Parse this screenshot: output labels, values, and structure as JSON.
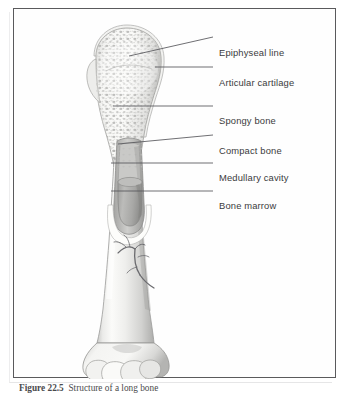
{
  "figure": {
    "title": "Structure of a long bone",
    "background_color": "#ffffff",
    "frame_color": "#5a5a5c",
    "leader_line_color": "#55555a"
  },
  "labels": [
    {
      "id": "epiphyseal-line",
      "text": "Epiphyseal line",
      "text_x": 218,
      "text_y": 44,
      "leader": {
        "x1": 128,
        "y1": 60,
        "x2": 212,
        "y2": 41
      }
    },
    {
      "id": "articular-cartilage",
      "text": "Articular cartilage",
      "text_x": 218,
      "text_y": 74,
      "leader": {
        "x1": 154,
        "y1": 71,
        "x2": 212,
        "y2": 71
      }
    },
    {
      "id": "spongy-bone",
      "text": "Spongy bone",
      "text_x": 218,
      "text_y": 112,
      "leader": {
        "x1": 112,
        "y1": 110,
        "x2": 212,
        "y2": 110
      }
    },
    {
      "id": "compact-bone",
      "text": "Compact bone",
      "text_x": 218,
      "text_y": 142,
      "leader": {
        "x1": 117,
        "y1": 148,
        "x2": 212,
        "y2": 139
      }
    },
    {
      "id": "medullary-cavity",
      "text": "Medullary cavity",
      "text_x": 218,
      "text_y": 169,
      "leader": {
        "x1": 110,
        "y1": 167,
        "x2": 212,
        "y2": 167
      }
    },
    {
      "id": "bone-marrow",
      "text": "Bone marrow",
      "text_x": 218,
      "text_y": 197,
      "leader": {
        "x1": 110,
        "y1": 195,
        "x2": 212,
        "y2": 195
      }
    }
  ],
  "caption": {
    "label": "Figure 22.5",
    "text": "Structure of a long bone"
  },
  "anatomy": {
    "regions": [
      {
        "name": "proximal-epiphysis",
        "description": "rounded head with trabecular spongy bone stippling"
      },
      {
        "name": "diaphysis",
        "description": "shaft with compact bone wall, cut away to reveal interior"
      },
      {
        "name": "medullary-cavity",
        "description": "hollow central canal in the shaft"
      },
      {
        "name": "bone-marrow",
        "description": "gray marrow block filling the medullary cavity"
      },
      {
        "name": "nutrient-vessel",
        "description": "branching artery on the shaft surface"
      },
      {
        "name": "distal-epiphysis",
        "description": "condyles at the lower end"
      }
    ],
    "palette": {
      "bone_light": "#f7f7f5",
      "bone_mid": "#dedede",
      "bone_shadow": "#b6b6b6",
      "spongy_dot": "#b9b9b9",
      "marrow": "#a9a9a9",
      "vessel": "#6e6e72",
      "outline": "#8e8e90"
    }
  }
}
